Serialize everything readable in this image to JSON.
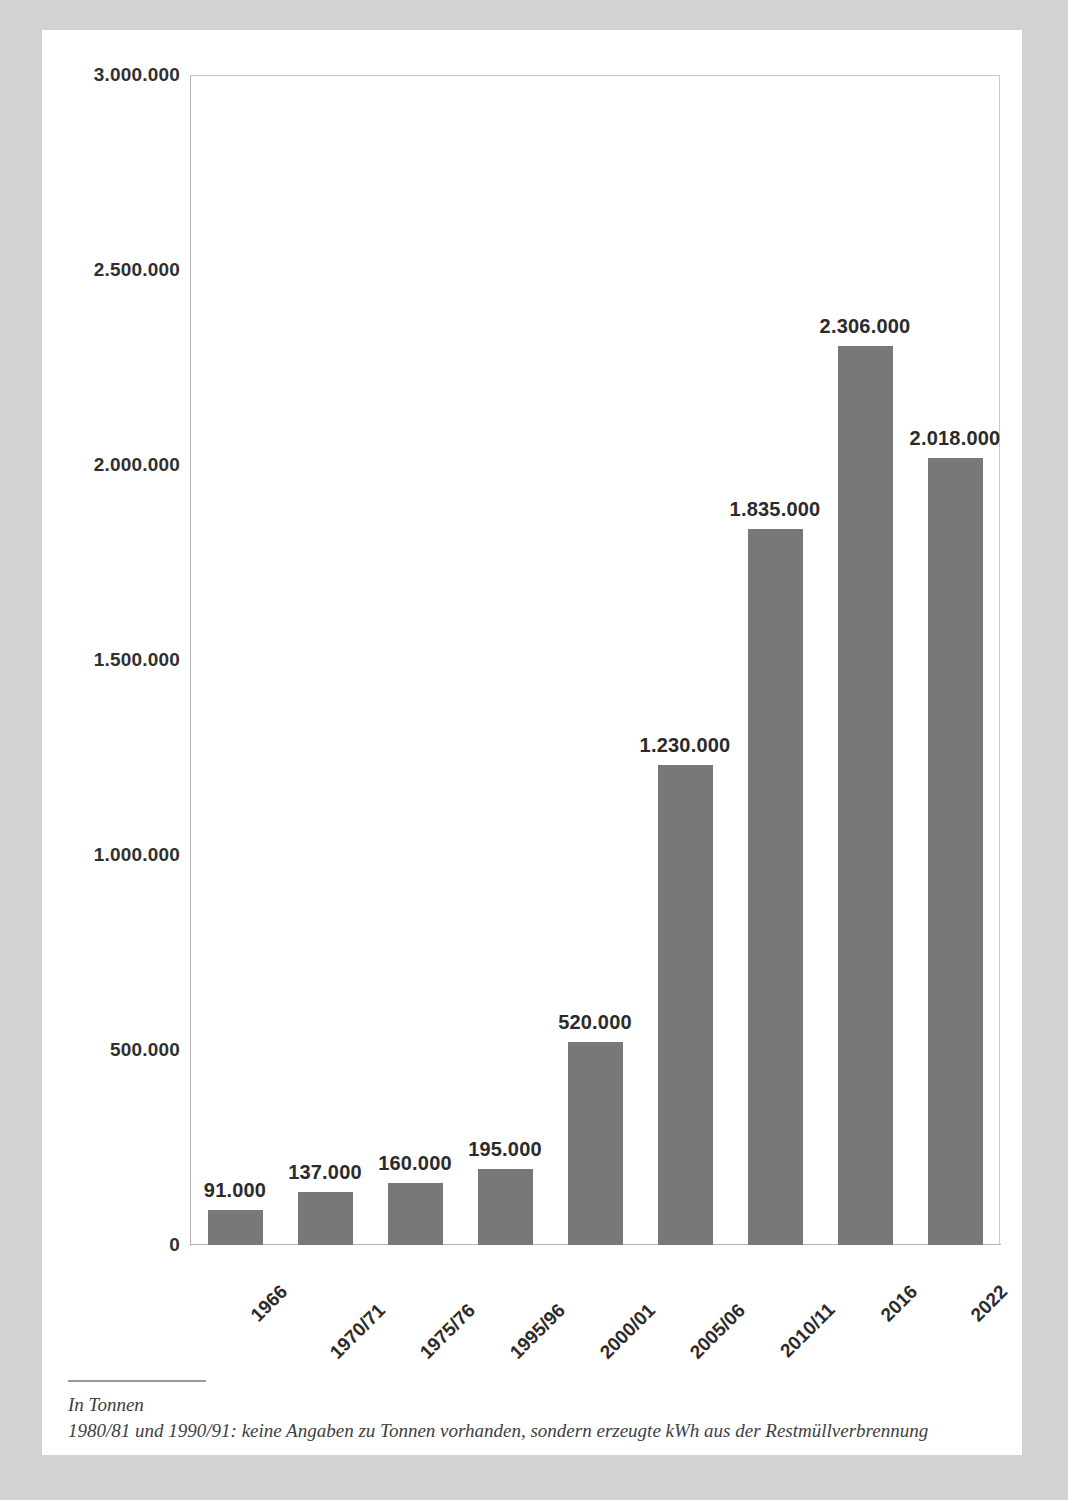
{
  "chart_data": {
    "type": "bar",
    "title": "",
    "subtitle": "",
    "xlabel": "",
    "ylabel": "",
    "categories": [
      "1966",
      "1970/71",
      "1975/76",
      "1995/96",
      "2000/01",
      "2005/06",
      "2010/11",
      "2016",
      "2022"
    ],
    "values": [
      91000,
      137000,
      160000,
      195000,
      520000,
      1230000,
      1835000,
      2306000,
      2018000
    ],
    "value_labels": [
      "91.000",
      "137.000",
      "160.000",
      "195.000",
      "520.000",
      "1.230.000",
      "1.835.000",
      "2.306.000",
      "2.018.000"
    ],
    "ylim": [
      0,
      3000000
    ],
    "ytick_values": [
      0,
      500000,
      1000000,
      1500000,
      2000000,
      2500000,
      3000000
    ],
    "ytick_labels": [
      "0",
      "500.000",
      "1.000.000",
      "1.500.000",
      "2.000.000",
      "2.500.000",
      "3.000.000"
    ],
    "grid": false,
    "legend": false,
    "bar_color": "#787878",
    "value_label_color": "#2b2b2b",
    "axis_color": "#b4b4b4",
    "background_color": "#ffffff",
    "page_surround_color": "#d2d2d2",
    "xtick_rotation": -45
  },
  "footnote": {
    "line1": "In Tonnen",
    "line2": "1980/81 und 1990/91: keine Angaben zu Tonnen vorhanden, sondern erzeugte kWh aus der Restmüllverbrennung"
  }
}
